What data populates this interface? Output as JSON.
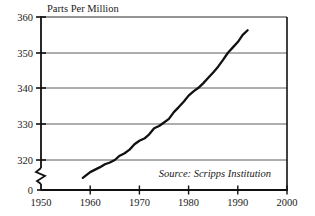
{
  "chart_data": {
    "type": "line",
    "title": "",
    "subtitle": "",
    "ylabel": "Parts Per Million",
    "xlabel": "",
    "grid": true,
    "legend": "none",
    "annotation": "Source: Scripps Institution",
    "xlim": [
      1950,
      2000
    ],
    "ylim": [
      315,
      360
    ],
    "y_axis_break": true,
    "y_break_label": "0",
    "xticks": [
      1950,
      1960,
      1970,
      1980,
      1990,
      2000
    ],
    "xtick_labels": [
      "1950",
      "1960",
      "1970",
      "1980",
      "1990",
      "2000"
    ],
    "yticks": [
      320,
      330,
      340,
      350,
      360
    ],
    "ytick_labels": [
      "320",
      "330",
      "340",
      "350",
      "360"
    ],
    "series": [
      {
        "name": "Atmospheric CO2 concentration",
        "x": [
          1958.5,
          1960,
          1961,
          1962,
          1963,
          1964,
          1965,
          1966,
          1967,
          1968,
          1969,
          1970,
          1971,
          1972,
          1973,
          1974,
          1975,
          1976,
          1977,
          1978,
          1979,
          1980,
          1981,
          1982,
          1983,
          1984,
          1985,
          1986,
          1987,
          1988,
          1989,
          1990,
          1991,
          1992
        ],
        "values": [
          315.0,
          316.6,
          317.3,
          318.0,
          318.8,
          319.3,
          320.0,
          321.2,
          321.9,
          322.9,
          324.4,
          325.4,
          326.0,
          327.2,
          328.9,
          329.5,
          330.5,
          331.5,
          333.4,
          334.8,
          336.3,
          338.0,
          339.2,
          340.2,
          341.5,
          343.0,
          344.5,
          346.1,
          348.0,
          350.0,
          351.5,
          353.0,
          355.0,
          356.3
        ]
      }
    ]
  },
  "axes": {
    "y_label": "Parts Per Million",
    "y_ticks": [
      "360",
      "350",
      "340",
      "330",
      "320",
      "0"
    ],
    "x_ticks": [
      "1950",
      "1960",
      "1970",
      "1980",
      "1990",
      "2000"
    ]
  },
  "annotations": {
    "source": "Source: Scripps Institution"
  },
  "colors": {
    "background": "#ffffff",
    "line": "#111111",
    "grid": "#3a3a3a",
    "axis": "#111111",
    "text": "#1a1a1a"
  }
}
